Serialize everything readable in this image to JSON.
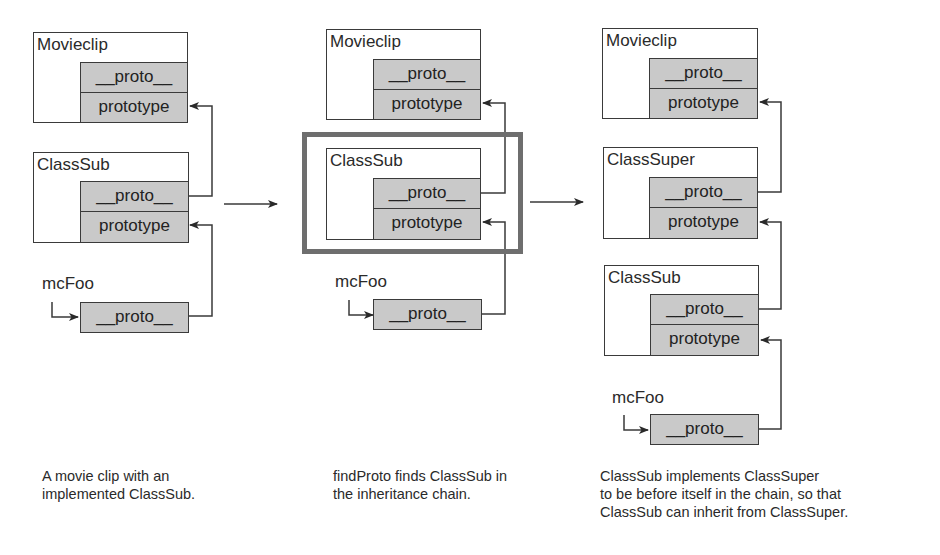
{
  "colors": {
    "line": "#3a3a3a",
    "cell_fill": "#c9c9c9",
    "highlight": "#6e6e6e"
  },
  "panels": [
    {
      "objects": [
        {
          "label": "Movieclip",
          "cells": [
            "__proto__",
            "prototype"
          ]
        },
        {
          "label": "ClassSub",
          "cells": [
            "__proto__",
            "prototype"
          ]
        }
      ],
      "instance": {
        "label": "mcFoo",
        "cell": "__proto__"
      },
      "caption": [
        "A movie clip with an",
        "implemented ClassSub."
      ]
    },
    {
      "objects": [
        {
          "label": "Movieclip",
          "cells": [
            "__proto__",
            "prototype"
          ]
        },
        {
          "label": "ClassSub",
          "cells": [
            "__proto__",
            "prototype"
          ],
          "highlighted": true
        }
      ],
      "instance": {
        "label": "mcFoo",
        "cell": "__proto__"
      },
      "caption": [
        "findProto finds ClassSub in",
        "the inheritance chain."
      ]
    },
    {
      "objects": [
        {
          "label": "Movieclip",
          "cells": [
            "__proto__",
            "prototype"
          ]
        },
        {
          "label": "ClassSuper",
          "cells": [
            "__proto__",
            "prototype"
          ]
        },
        {
          "label": "ClassSub",
          "cells": [
            "__proto__",
            "prototype"
          ]
        }
      ],
      "instance": {
        "label": "mcFoo",
        "cell": "__proto__"
      },
      "caption": [
        "ClassSub implements ClassSuper",
        "to be before itself in the chain, so that",
        "ClassSub can inherit from ClassSuper."
      ]
    }
  ],
  "transitions": [
    "panel-1-to-panel-2-arrow",
    "panel-2-to-panel-3-arrow"
  ]
}
